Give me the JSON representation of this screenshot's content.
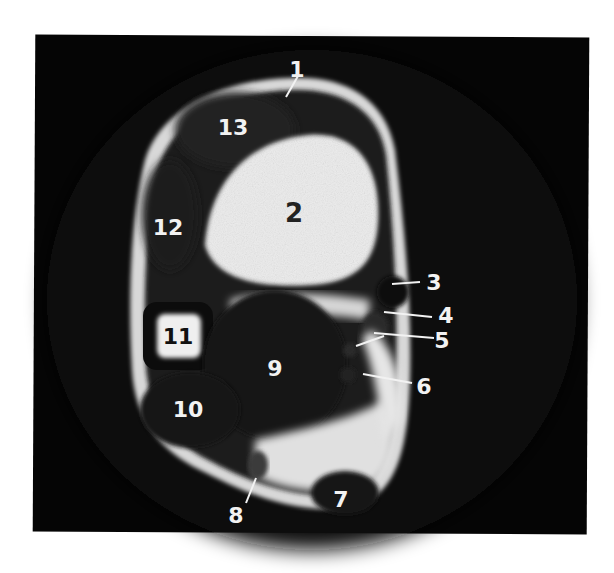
{
  "figure": {
    "type": "axial MRI slice",
    "background_color": "#050505",
    "label_color_light": "#f2f2f2",
    "label_color_dark": "#222222"
  },
  "labels": [
    {
      "id": "1",
      "text": "1"
    },
    {
      "id": "2",
      "text": "2"
    },
    {
      "id": "3",
      "text": "3"
    },
    {
      "id": "4",
      "text": "4"
    },
    {
      "id": "5",
      "text": "5"
    },
    {
      "id": "6",
      "text": "6"
    },
    {
      "id": "7",
      "text": "7"
    },
    {
      "id": "8",
      "text": "8"
    },
    {
      "id": "9",
      "text": "9"
    },
    {
      "id": "10",
      "text": "10"
    },
    {
      "id": "11",
      "text": "11"
    },
    {
      "id": "12",
      "text": "12"
    },
    {
      "id": "13",
      "text": "13"
    }
  ]
}
